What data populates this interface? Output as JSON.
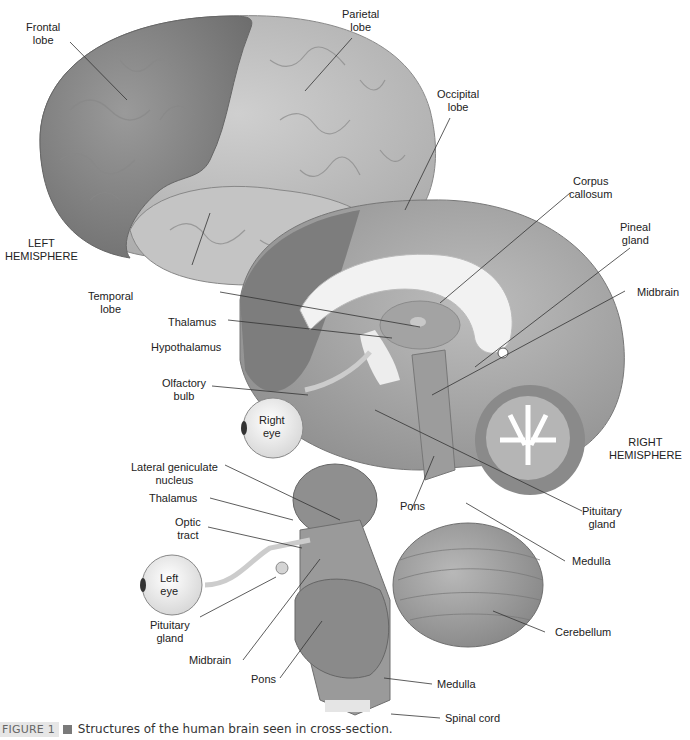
{
  "figure": {
    "caption_tag": "FIGURE 1",
    "caption_text": "Structures of the human brain seen in cross-section."
  },
  "labels": {
    "frontal_lobe": [
      "Frontal",
      "lobe"
    ],
    "parietal_lobe": [
      "Parietal",
      "lobe"
    ],
    "occipital_lobe": [
      "Occipital",
      "lobe"
    ],
    "left_hemisphere": [
      "LEFT",
      "HEMISPHERE"
    ],
    "temporal_lobe": [
      "Temporal",
      "lobe"
    ],
    "corpus_callosum": [
      "Corpus",
      "callosum"
    ],
    "pineal_gland": [
      "Pineal",
      "gland"
    ],
    "midbrain_right": "Midbrain",
    "thalamus_top": "Thalamus",
    "hypothalamus": "Hypothalamus",
    "olfactory_bulb": [
      "Olfactory",
      "bulb"
    ],
    "right_eye": [
      "Right",
      "eye"
    ],
    "right_hemisphere": [
      "RIGHT",
      "HEMISPHERE"
    ],
    "lateral_geniculate": [
      "Lateral geniculate",
      "nucleus"
    ],
    "thalamus_bottom": "Thalamus",
    "optic_tract": [
      "Optic",
      "tract"
    ],
    "pons_top": "Pons",
    "pituitary_right": [
      "Pituitary",
      "gland"
    ],
    "medulla_right": "Medulla",
    "left_eye": [
      "Left",
      "eye"
    ],
    "pituitary_left": [
      "Pituitary",
      "gland"
    ],
    "midbrain_bottom": "Midbrain",
    "cerebellum": "Cerebellum",
    "pons_bottom": "Pons",
    "medulla_bottom": "Medulla",
    "spinal_cord": "Spinal cord"
  }
}
